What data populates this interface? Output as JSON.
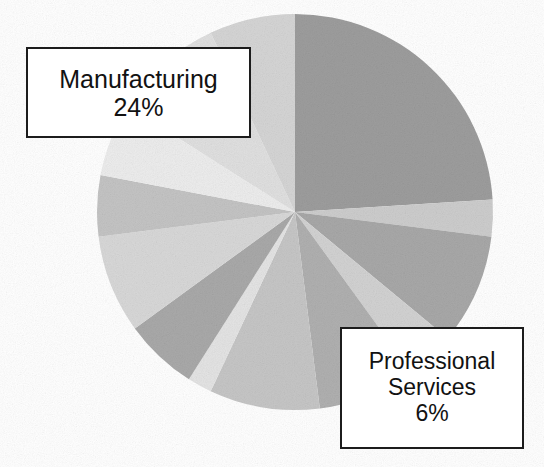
{
  "figure": {
    "background_color": "#ffffff",
    "type": "pie-chart-scan"
  },
  "callouts": [
    {
      "id": "manufacturing",
      "label": "Manufacturing",
      "value_text": "24%",
      "border_color": "#1c1c1c",
      "fill_color": "#ffffff"
    },
    {
      "id": "professional-services",
      "label_line1": "Professional",
      "label_line2": "Services",
      "value_text": "6%",
      "border_color": "#1c1c1c",
      "fill_color": "#ffffff"
    }
  ],
  "chart_data": {
    "type": "pie",
    "title": "",
    "xlabel": "",
    "ylabel": "",
    "legend": "none",
    "grid": false,
    "start_angle_deg": 0,
    "direction": "clockwise",
    "center_px": [
      295,
      212
    ],
    "radius_px": 198,
    "labeled_slices": [
      {
        "name": "Manufacturing",
        "value": 24,
        "unit": "%"
      },
      {
        "name": "Professional Services",
        "value": 6,
        "unit": "%"
      }
    ],
    "categories": [
      "Manufacturing",
      "Slice 2",
      "Slice 3",
      "Slice 4",
      "Slice 5",
      "Slice 6",
      "Slice 7",
      "Professional Services",
      "Slice 9",
      "Slice 10",
      "Slice 11",
      "Slice 12",
      "Slice 13"
    ],
    "values": [
      24,
      3,
      9,
      4,
      8,
      9,
      2,
      6,
      8,
      5,
      6,
      9,
      7
    ],
    "colors": [
      "#9d9d9d",
      "#cdcdcd",
      "#a8a8a8",
      "#d2d2d2",
      "#b0b0b0",
      "#c6c6c6",
      "#e4e4e4",
      "#a9a9a9",
      "#d8d8d8",
      "#c4c4c4",
      "#ededed",
      "#e0e0e0",
      "#d5d5d5"
    ],
    "ylim": [
      0,
      100
    ]
  }
}
